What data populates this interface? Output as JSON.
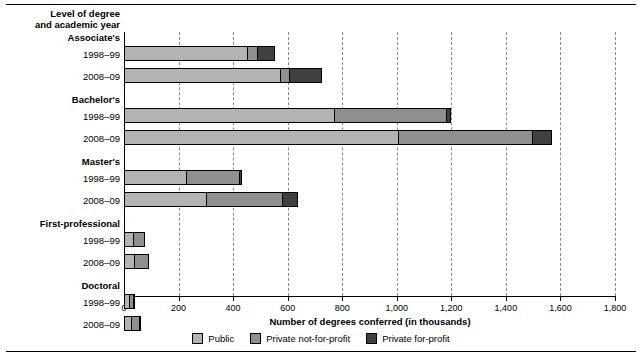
{
  "chart_data": {
    "type": "bar",
    "orientation": "horizontal",
    "stacked": true,
    "title": "",
    "category_axis_title": "Level of degree and academic year",
    "category_axis_title_lines": [
      "Level of degree",
      "and academic year"
    ],
    "xlabel": "Number of degrees conferred (in thousands)",
    "ylabel": "",
    "xlim": [
      0,
      1800
    ],
    "xticks": [
      0,
      200,
      400,
      600,
      800,
      1000,
      1200,
      1400,
      1600,
      1800
    ],
    "xticklabels": [
      "0",
      "200",
      "400",
      "600",
      "800",
      "1,000",
      "1,200",
      "1,400",
      "1,600",
      "1,800"
    ],
    "grid": "vertical-dashed",
    "legend_position": "bottom-center",
    "series": [
      {
        "name": "Public",
        "color": "#b3b3b3"
      },
      {
        "name": "Private not-for-profit",
        "color": "#8f8f8f"
      },
      {
        "name": "Private for-profit",
        "color": "#404040"
      }
    ],
    "groups": [
      {
        "label": "Associate's",
        "rows": [
          {
            "year": "1998–99",
            "values": [
              455,
              35,
              63
            ],
            "total": 553
          },
          {
            "year": "2008–09",
            "values": [
              575,
              33,
              117
            ],
            "total": 725
          }
        ]
      },
      {
        "label": "Bachelor's",
        "rows": [
          {
            "year": "1998–99",
            "values": [
              770,
              415,
              12
            ],
            "total": 1197
          },
          {
            "year": "2008–09",
            "values": [
              1005,
              495,
              68
            ],
            "total": 1568
          }
        ]
      },
      {
        "label": "Master's",
        "rows": [
          {
            "year": "1998–99",
            "values": [
              228,
              197,
              8
            ],
            "total": 433
          },
          {
            "year": "2008–09",
            "values": [
              300,
              283,
              55
            ],
            "total": 638
          }
        ]
      },
      {
        "label": "First-professional",
        "rows": [
          {
            "year": "1998–99",
            "values": [
              33,
              44,
              0
            ],
            "total": 77
          },
          {
            "year": "2008–09",
            "values": [
              37,
              55,
              0
            ],
            "total": 92
          }
        ]
      },
      {
        "label": "Doctoral",
        "rows": [
          {
            "year": "1998–99",
            "values": [
              19,
              19,
              3
            ],
            "total": 41
          },
          {
            "year": "2008–09",
            "values": [
              26,
              32,
              6
            ],
            "total": 64
          }
        ]
      }
    ]
  },
  "legend": {
    "items": [
      {
        "label": "Public",
        "color": "#b3b3b3"
      },
      {
        "label": "Private not-for-profit",
        "color": "#8f8f8f"
      },
      {
        "label": "Private for-profit",
        "color": "#404040"
      }
    ]
  }
}
